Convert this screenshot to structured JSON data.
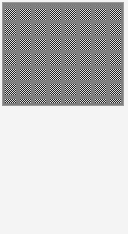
{
  "swatch": {
    "pattern": "checkerboard-dither",
    "colors": {
      "dark": "#222222",
      "light": "#dddddd",
      "grid": "#808080",
      "frame": "#f4f4f4",
      "border": "#9a9a9a"
    }
  }
}
